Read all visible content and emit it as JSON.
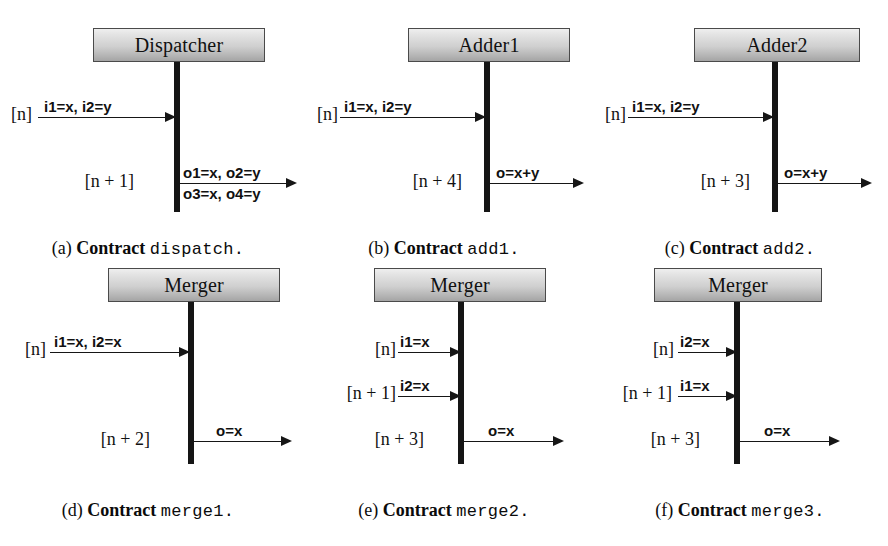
{
  "figure": {
    "kind": "sequence-diagram-grid",
    "columns": 3,
    "rows": 2
  },
  "subfigures": [
    {
      "id": "a",
      "actor": "Dispatcher",
      "caption_index": "(a)",
      "caption_word": "Contract",
      "caption_mono": "dispatch.",
      "messages": [
        {
          "time": "[n]",
          "direction": "in",
          "label_above": "i1=x, i2=y",
          "label_below": ""
        },
        {
          "time": "[n + 1]",
          "direction": "out",
          "label_above": "o1=x, o2=y",
          "label_below": "o3=x, o4=y"
        }
      ]
    },
    {
      "id": "b",
      "actor": "Adder1",
      "caption_index": "(b)",
      "caption_word": "Contract",
      "caption_mono": "add1.",
      "messages": [
        {
          "time": "[n]",
          "direction": "in",
          "label_above": "i1=x, i2=y",
          "label_below": ""
        },
        {
          "time": "[n + 4]",
          "direction": "out",
          "label_above": "o=x+y",
          "label_below": ""
        }
      ]
    },
    {
      "id": "c",
      "actor": "Adder2",
      "caption_index": "(c)",
      "caption_word": "Contract",
      "caption_mono": "add2.",
      "messages": [
        {
          "time": "[n]",
          "direction": "in",
          "label_above": "i1=x, i2=y",
          "label_below": ""
        },
        {
          "time": "[n + 3]",
          "direction": "out",
          "label_above": "o=x+y",
          "label_below": ""
        }
      ]
    },
    {
      "id": "d",
      "actor": "Merger",
      "caption_index": "(d)",
      "caption_word": "Contract",
      "caption_mono": "merge1.",
      "messages": [
        {
          "time": "[n]",
          "direction": "in",
          "label_above": "i1=x, i2=x",
          "label_below": ""
        },
        {
          "time": "[n + 2]",
          "direction": "out",
          "label_above": "o=x",
          "label_below": ""
        }
      ]
    },
    {
      "id": "e",
      "actor": "Merger",
      "caption_index": "(e)",
      "caption_word": "Contract",
      "caption_mono": "merge2.",
      "messages": [
        {
          "time": "[n]",
          "direction": "in",
          "label_above": "i1=x",
          "label_below": ""
        },
        {
          "time": "[n + 1]",
          "direction": "in",
          "label_above": "i2=x",
          "label_below": ""
        },
        {
          "time": "[n + 3]",
          "direction": "out",
          "label_above": "o=x",
          "label_below": ""
        }
      ]
    },
    {
      "id": "f",
      "actor": "Merger",
      "caption_index": "(f)",
      "caption_word": "Contract",
      "caption_mono": "merge3.",
      "messages": [
        {
          "time": "[n]",
          "direction": "in",
          "label_above": "i2=x",
          "label_below": ""
        },
        {
          "time": "[n + 1]",
          "direction": "in",
          "label_above": "i1=x",
          "label_below": ""
        },
        {
          "time": "[n + 3]",
          "direction": "out",
          "label_above": "o=x",
          "label_below": ""
        }
      ]
    }
  ],
  "colors": {
    "page_background": "#ffffff",
    "box_border": "#4a4a4a",
    "box_gradient_top": "#efefef",
    "box_gradient_bottom": "#a4a4a4",
    "lifeline": "#151515",
    "ink": "#111111"
  }
}
